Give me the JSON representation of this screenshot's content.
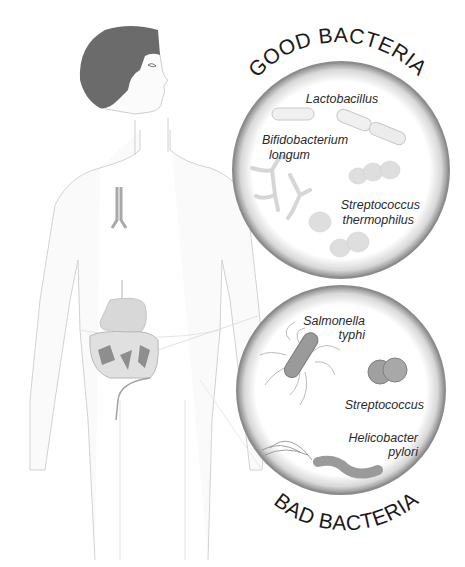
{
  "diagram": {
    "good": {
      "title": "GOOD BACTERIA",
      "labels": {
        "lacto": "Lactobacillus",
        "bifido1": "Bifidobacterium",
        "bifido2": "longum",
        "strep1": "Streptococcus",
        "strep2": "thermophilus"
      }
    },
    "bad": {
      "title": "BAD BACTERIA",
      "labels": {
        "salm1": "Salmonella",
        "salm2": "typhi",
        "strep": "Streptococcus",
        "heli1": "Helicobacter",
        "heli2": "pylori"
      }
    },
    "colors": {
      "hair": "#6b6b6b",
      "body_outline": "#cfcfcf",
      "circle_rim": "#8c8c8c",
      "bacteria_good": "#e4e4e4",
      "bacteria_bad": "#9a9a9a"
    }
  }
}
